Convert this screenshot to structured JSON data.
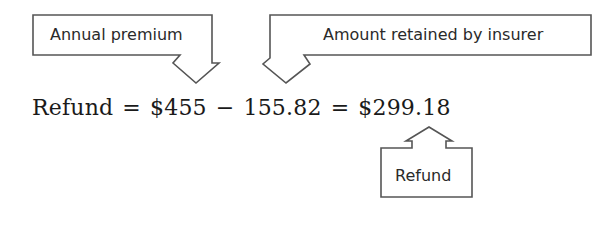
{
  "callouts": {
    "annual_premium": "Annual premium",
    "amount_retained": "Amount retained by insurer",
    "refund": "Refund"
  },
  "equation": {
    "lhs": "Refund",
    "eq1": "=",
    "premium": "$455",
    "minus": "−",
    "retained": "155.82",
    "eq2": "=",
    "result": "$299.18"
  },
  "colors": {
    "stroke": "#555555",
    "text": "#1a1a1a"
  }
}
